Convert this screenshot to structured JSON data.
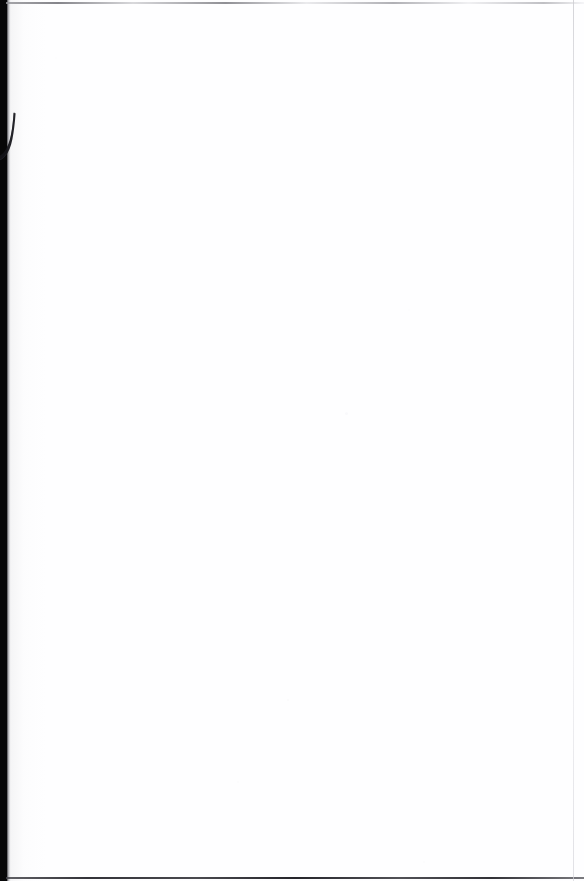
{
  "document": {
    "kind": "scanned-page-image",
    "page_content": "",
    "page_text": "",
    "body_text": "",
    "note": ""
  },
  "canvas": {
    "width_px": 584,
    "height_px": 881,
    "background_color": "#ffffff",
    "paper_color": "#fefeff"
  },
  "artifacts": {
    "gutter_band": {
      "name": "scanner-gutter-shadow",
      "color": "#070708",
      "x_px": 0,
      "y_px": 0,
      "width_px": 7,
      "height_px": 881
    },
    "gutter_feather": {
      "name": "gutter-edge-feather",
      "color_start": "#4a4a4e",
      "color_end": "#fdfdfe",
      "x_px": 7,
      "width_px": 4
    },
    "ink_hook": {
      "name": "partial-ink-stroke",
      "description": "curved hook stroke",
      "color": "#12121a",
      "x_px": 0,
      "y_px": 112,
      "width_px": 22,
      "height_px": 54
    },
    "edge_rule_top": {
      "name": "page-edge-line-top",
      "color": "#8c8c92",
      "y_px": 2,
      "thickness_px": 2
    },
    "edge_rule_bottom": {
      "name": "page-edge-line-bottom",
      "color": "#2a2a30",
      "y_px": 877,
      "thickness_px": 2
    },
    "edge_rule_right": {
      "name": "page-edge-line-right",
      "color": "#d2d2d8",
      "x_px": 573,
      "thickness_px": 1
    },
    "specks": [
      {
        "x_px": 345,
        "y_px": 412,
        "size_px": 3,
        "opacity": 0.2
      },
      {
        "x_px": 287,
        "y_px": 699,
        "size_px": 2,
        "opacity": 0.14
      },
      {
        "x_px": 237,
        "y_px": 781,
        "size_px": 2,
        "opacity": 0.12
      },
      {
        "x_px": 55,
        "y_px": 57,
        "size_px": 2,
        "opacity": 0.1
      },
      {
        "x_px": 408,
        "y_px": 309,
        "size_px": 2,
        "opacity": 0.1
      },
      {
        "x_px": 423,
        "y_px": 861,
        "size_px": 2,
        "opacity": 0.12
      }
    ]
  }
}
